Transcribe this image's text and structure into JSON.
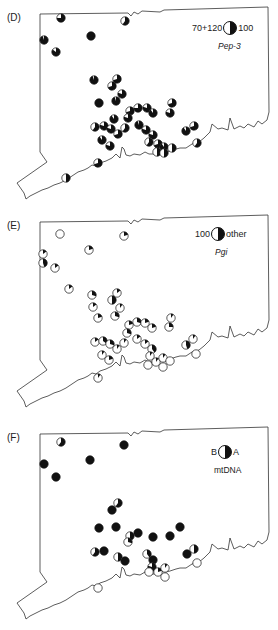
{
  "figure": {
    "panels": [
      {
        "label": "(D)",
        "legend": {
          "left": "70+120",
          "right": "100",
          "title": "Pep-3",
          "title_italic": true
        },
        "colors": {
          "fill_left": "#ffffff",
          "fill_right": "#111111"
        }
      },
      {
        "label": "(E)",
        "legend": {
          "left": "100",
          "right": "other",
          "title": "Pgi",
          "title_italic": true
        },
        "colors": {
          "fill_left": "#ffffff",
          "fill_right": "#111111"
        }
      },
      {
        "label": "(F)",
        "legend": {
          "left": "B",
          "right": "A",
          "title": "mtDNA",
          "title_italic": false
        },
        "colors": {
          "fill_left": "#ffffff",
          "fill_right": "#111111"
        }
      }
    ]
  },
  "chart_data": {
    "type": "map-pie",
    "panels": [
      {
        "label": "(D)",
        "locus": "Pep-3",
        "categories": [
          "70+120",
          "100"
        ],
        "sites": [
          {
            "x": 61,
            "y": 18,
            "f": 0.75
          },
          {
            "x": 125,
            "y": 21,
            "f": 0.6
          },
          {
            "x": 44,
            "y": 40,
            "f": 0.95
          },
          {
            "x": 91,
            "y": 36,
            "f": 1.0
          },
          {
            "x": 56,
            "y": 52,
            "f": 0.85
          },
          {
            "x": 94,
            "y": 80,
            "f": 0.95
          },
          {
            "x": 117,
            "y": 79,
            "f": 0.7
          },
          {
            "x": 112,
            "y": 86,
            "f": 0.7
          },
          {
            "x": 122,
            "y": 94,
            "f": 0.8
          },
          {
            "x": 99,
            "y": 103,
            "f": 1.0
          },
          {
            "x": 116,
            "y": 101,
            "f": 0.95
          },
          {
            "x": 172,
            "y": 103,
            "f": 0.7
          },
          {
            "x": 170,
            "y": 113,
            "f": 0.8
          },
          {
            "x": 130,
            "y": 111,
            "f": 0.7
          },
          {
            "x": 138,
            "y": 108,
            "f": 0.75
          },
          {
            "x": 147,
            "y": 108,
            "f": 0.8
          },
          {
            "x": 153,
            "y": 113,
            "f": 0.9
          },
          {
            "x": 128,
            "y": 118,
            "f": 0.8
          },
          {
            "x": 114,
            "y": 119,
            "f": 0.9
          },
          {
            "x": 95,
            "y": 127,
            "f": 0.6
          },
          {
            "x": 104,
            "y": 126,
            "f": 0.8
          },
          {
            "x": 111,
            "y": 129,
            "f": 0.8
          },
          {
            "x": 118,
            "y": 134,
            "f": 0.7
          },
          {
            "x": 125,
            "y": 128,
            "f": 0.6
          },
          {
            "x": 139,
            "y": 125,
            "f": 0.95
          },
          {
            "x": 146,
            "y": 130,
            "f": 0.8
          },
          {
            "x": 153,
            "y": 135,
            "f": 0.8
          },
          {
            "x": 186,
            "y": 131,
            "f": 0.9
          },
          {
            "x": 194,
            "y": 126,
            "f": 0.7
          },
          {
            "x": 102,
            "y": 140,
            "f": 0.9
          },
          {
            "x": 110,
            "y": 146,
            "f": 0.8
          },
          {
            "x": 149,
            "y": 142,
            "f": 0.6
          },
          {
            "x": 158,
            "y": 144,
            "f": 0.7
          },
          {
            "x": 157,
            "y": 152,
            "f": 0.5
          },
          {
            "x": 164,
            "y": 147,
            "f": 0.9
          },
          {
            "x": 172,
            "y": 148,
            "f": 0.5
          },
          {
            "x": 164,
            "y": 153,
            "f": 0.5
          },
          {
            "x": 197,
            "y": 143,
            "f": 0.6
          },
          {
            "x": 98,
            "y": 163,
            "f": 0.7
          },
          {
            "x": 66,
            "y": 178,
            "f": 0.5
          }
        ]
      },
      {
        "label": "(E)",
        "locus": "Pgi",
        "categories": [
          "100",
          "other"
        ],
        "sites": [
          {
            "x": 60,
            "y": 26,
            "f": 0.0
          },
          {
            "x": 124,
            "y": 28,
            "f": 0.2
          },
          {
            "x": 43,
            "y": 46,
            "f": 0.15
          },
          {
            "x": 89,
            "y": 42,
            "f": 0.2
          },
          {
            "x": 43,
            "y": 55,
            "f": 0.45
          },
          {
            "x": 55,
            "y": 60,
            "f": 0.15
          },
          {
            "x": 69,
            "y": 81,
            "f": 0.15
          },
          {
            "x": 92,
            "y": 87,
            "f": 0.3
          },
          {
            "x": 117,
            "y": 85,
            "f": 0.15
          },
          {
            "x": 112,
            "y": 92,
            "f": 0.5
          },
          {
            "x": 93,
            "y": 99,
            "f": 0.15
          },
          {
            "x": 120,
            "y": 100,
            "f": 0.1
          },
          {
            "x": 98,
            "y": 110,
            "f": 0.2
          },
          {
            "x": 115,
            "y": 108,
            "f": 0.3
          },
          {
            "x": 171,
            "y": 110,
            "f": 0.1
          },
          {
            "x": 169,
            "y": 119,
            "f": 0.25
          },
          {
            "x": 137,
            "y": 114,
            "f": 0.3
          },
          {
            "x": 129,
            "y": 117,
            "f": 0.2
          },
          {
            "x": 145,
            "y": 115,
            "f": 0.2
          },
          {
            "x": 152,
            "y": 120,
            "f": 0.2
          },
          {
            "x": 127,
            "y": 125,
            "f": 0.3
          },
          {
            "x": 95,
            "y": 134,
            "f": 0.15
          },
          {
            "x": 103,
            "y": 133,
            "f": 0.35
          },
          {
            "x": 110,
            "y": 136,
            "f": 0.3
          },
          {
            "x": 117,
            "y": 141,
            "f": 0.1
          },
          {
            "x": 124,
            "y": 135,
            "f": 0.1
          },
          {
            "x": 137,
            "y": 131,
            "f": 0.15
          },
          {
            "x": 145,
            "y": 136,
            "f": 0.15
          },
          {
            "x": 152,
            "y": 141,
            "f": 0.4
          },
          {
            "x": 150,
            "y": 148,
            "f": 0.1
          },
          {
            "x": 186,
            "y": 137,
            "f": 0.45
          },
          {
            "x": 193,
            "y": 131,
            "f": 0.1
          },
          {
            "x": 102,
            "y": 147,
            "f": 0.1
          },
          {
            "x": 109,
            "y": 152,
            "f": 0.2
          },
          {
            "x": 148,
            "y": 157,
            "f": 0.0
          },
          {
            "x": 156,
            "y": 154,
            "f": 0.1
          },
          {
            "x": 163,
            "y": 150,
            "f": 0.1
          },
          {
            "x": 170,
            "y": 153,
            "f": 0.0
          },
          {
            "x": 163,
            "y": 159,
            "f": 0.0
          },
          {
            "x": 196,
            "y": 146,
            "f": 0.0
          },
          {
            "x": 98,
            "y": 170,
            "f": 0.1
          }
        ]
      },
      {
        "label": "(F)",
        "locus": "mtDNA",
        "categories": [
          "B",
          "A"
        ],
        "sites": [
          {
            "x": 61,
            "y": 22,
            "f": 0.6
          },
          {
            "x": 124,
            "y": 25,
            "f": 1.0
          },
          {
            "x": 44,
            "y": 44,
            "f": 1.0
          },
          {
            "x": 90,
            "y": 40,
            "f": 1.0
          },
          {
            "x": 56,
            "y": 57,
            "f": 1.0
          },
          {
            "x": 118,
            "y": 83,
            "f": 0.6
          },
          {
            "x": 112,
            "y": 90,
            "f": 1.0
          },
          {
            "x": 99,
            "y": 108,
            "f": 1.0
          },
          {
            "x": 116,
            "y": 107,
            "f": 1.0
          },
          {
            "x": 180,
            "y": 107,
            "f": 1.0
          },
          {
            "x": 130,
            "y": 116,
            "f": 0.5
          },
          {
            "x": 138,
            "y": 113,
            "f": 1.0
          },
          {
            "x": 128,
            "y": 122,
            "f": 0.3
          },
          {
            "x": 153,
            "y": 117,
            "f": 1.0
          },
          {
            "x": 170,
            "y": 116,
            "f": 1.0
          },
          {
            "x": 95,
            "y": 132,
            "f": 0.6
          },
          {
            "x": 104,
            "y": 131,
            "f": 1.0
          },
          {
            "x": 118,
            "y": 137,
            "f": 0.5
          },
          {
            "x": 125,
            "y": 141,
            "f": 1.0
          },
          {
            "x": 147,
            "y": 134,
            "f": 0.4
          },
          {
            "x": 153,
            "y": 140,
            "f": 1.0
          },
          {
            "x": 152,
            "y": 147,
            "f": 0.8
          },
          {
            "x": 149,
            "y": 152,
            "f": 0.0
          },
          {
            "x": 158,
            "y": 152,
            "f": 0.2
          },
          {
            "x": 165,
            "y": 148,
            "f": 0.1
          },
          {
            "x": 165,
            "y": 157,
            "f": 0.0
          },
          {
            "x": 187,
            "y": 134,
            "f": 1.0
          },
          {
            "x": 194,
            "y": 129,
            "f": 0.5
          },
          {
            "x": 197,
            "y": 143,
            "f": 0.0
          },
          {
            "x": 98,
            "y": 168,
            "f": 0.0
          }
        ]
      }
    ]
  }
}
